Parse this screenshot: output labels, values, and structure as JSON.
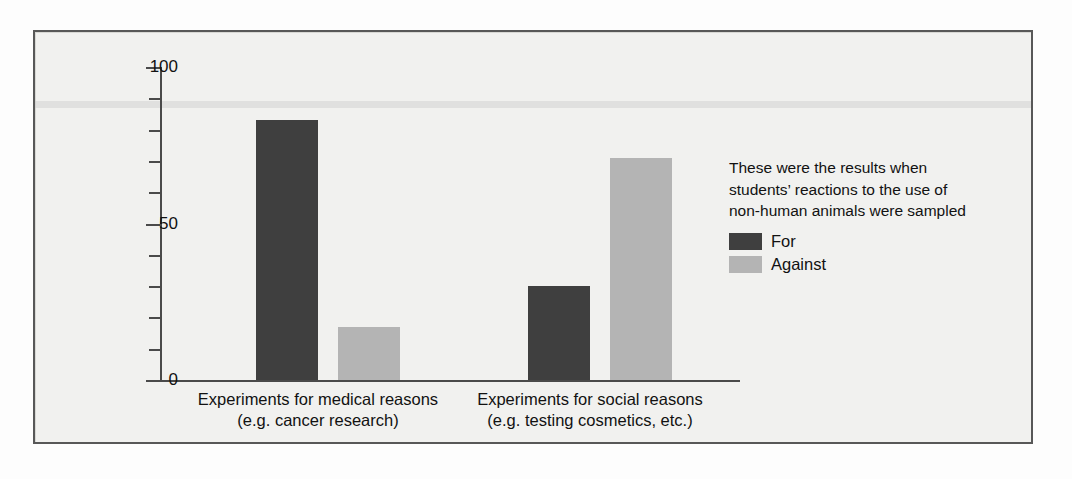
{
  "chart_data": {
    "type": "bar",
    "title": "",
    "xlabel": "",
    "ylabel": "Percentage of students",
    "ylim": [
      0,
      100
    ],
    "ytick_labels": [
      "0",
      "50",
      "100"
    ],
    "ytick_values": [
      0,
      50,
      100
    ],
    "minor_tick_interval": 10,
    "grid": false,
    "legend_position": "right",
    "categories": [
      "Experiments for medical reasons\n(e.g. cancer research)",
      "Experiments for social reasons\n(e.g. testing cosmetics, etc.)"
    ],
    "category_lines": [
      [
        "Experiments for medical reasons",
        "(e.g. cancer research)"
      ],
      [
        "Experiments for social reasons",
        "(e.g. testing cosmetics, etc.)"
      ]
    ],
    "series": [
      {
        "name": "For",
        "color": "#3f3f3f",
        "values": [
          83,
          30
        ]
      },
      {
        "name": "Against",
        "color": "#b4b4b4",
        "values": [
          17,
          71
        ]
      }
    ],
    "annotation": [
      "These were the results when",
      "students’ reactions to the use of",
      "non-human animals were sampled"
    ]
  },
  "colors": {
    "for_series": "#3f3f3f",
    "against_series": "#b4b4b4",
    "axis": "#4a4a4a",
    "frame_border": "#585858",
    "panel_background": "#f1f1ef",
    "page_background": "#fdfdfd",
    "text": "#121212"
  }
}
